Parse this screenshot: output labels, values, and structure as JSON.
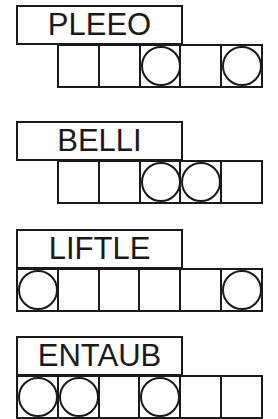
{
  "puzzles": [
    {
      "scrambled": "PLEEO",
      "cells": 5,
      "circled": [
        3,
        5
      ],
      "offset": 1
    },
    {
      "scrambled": "BELLI",
      "cells": 5,
      "circled": [
        3,
        4
      ],
      "offset": 1
    },
    {
      "scrambled": "LIFTLE",
      "cells": 6,
      "circled": [
        1,
        6
      ],
      "offset": 0
    },
    {
      "scrambled": "ENTAUB",
      "cells": 6,
      "circled": [
        1,
        2,
        4
      ],
      "offset": 0
    }
  ]
}
